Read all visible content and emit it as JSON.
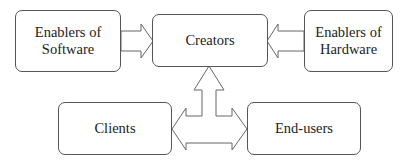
{
  "diagram": {
    "nodes": {
      "enablers_software": {
        "line1": "Enablers of",
        "line2": "Software"
      },
      "creators": {
        "label": "Creators"
      },
      "enablers_hardware": {
        "line1": "Enablers of",
        "line2": "Hardware"
      },
      "clients": {
        "label": "Clients"
      },
      "end_users": {
        "label": "End-users"
      }
    },
    "edges": [
      {
        "from": "Enablers of Software",
        "to": "Creators",
        "style": "block-arrow"
      },
      {
        "from": "Enablers of Hardware",
        "to": "Creators",
        "style": "block-arrow"
      },
      {
        "from": "Clients / End-users",
        "to": "Creators",
        "style": "tri-directional block-arrow"
      },
      {
        "from": "Clients",
        "to": "End-users",
        "style": "bi-directional block-arrow"
      }
    ],
    "colors": {
      "stroke": "#555555",
      "text": "#222222",
      "background": "#ffffff"
    }
  }
}
